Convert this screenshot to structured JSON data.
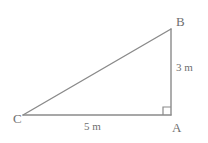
{
  "figure": {
    "type": "right-triangle-geometry-diagram",
    "background_color": "#ffffff",
    "stroke_color": "#8a8a8a",
    "label_color": "#6f6f6f",
    "vertices": {
      "a": {
        "label": "A",
        "x": 171,
        "y": 115,
        "role": "right-angle-vertex"
      },
      "b": {
        "label": "B",
        "x": 171,
        "y": 29,
        "role": "top-vertex"
      },
      "c": {
        "label": "C",
        "x": 23,
        "y": 115,
        "role": "left-vertex"
      }
    },
    "sides": [
      {
        "name": "vertical-side-ab",
        "label": "3 m",
        "from": "A",
        "to": "B",
        "length_value": 3,
        "unit": "m"
      },
      {
        "name": "horizontal-side-ca",
        "label": "5 m",
        "from": "C",
        "to": "A",
        "length_value": 5,
        "unit": "m"
      },
      {
        "name": "hypotenuse-cb",
        "label": "",
        "from": "C",
        "to": "B"
      }
    ],
    "right_angle_marker": {
      "name": "right-angle-square",
      "at_vertex": "A",
      "size": 8
    }
  }
}
